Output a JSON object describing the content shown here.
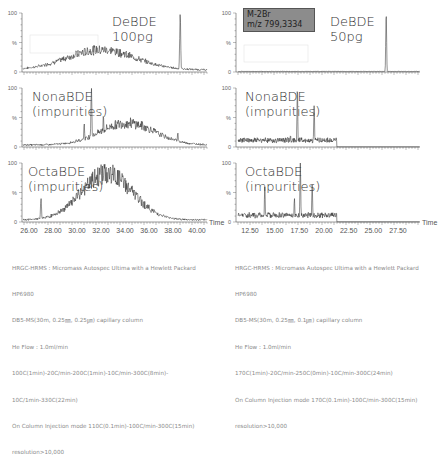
{
  "chart_data": [
    {
      "type": "line",
      "title": "DeBDE 100pg",
      "panel": "left-top",
      "label_lines": [
        "DeBDE",
        "100pg"
      ],
      "xlabel": "Time",
      "ylabel": "%",
      "y_ticks": [
        "100",
        "%",
        "0"
      ],
      "xlim": [
        25.5,
        41.0
      ],
      "ylim": [
        0,
        100
      ],
      "description": "broad hump (max ~35% near 32 min) with sharp peak to 100% near 38.6 min",
      "peaks": [
        {
          "x": 38.6,
          "y": 100
        }
      ],
      "hump": {
        "center": 32.0,
        "height": 35,
        "width": 4.0
      }
    },
    {
      "type": "line",
      "title": "NonaBDE (impurities)",
      "panel": "left-middle",
      "label_lines": [
        "NonaBDE",
        "(impurities)"
      ],
      "xlabel": "Time",
      "ylabel": "%",
      "y_ticks": [
        "100",
        "%",
        "0"
      ],
      "xlim": [
        25.5,
        41.0
      ],
      "ylim": [
        0,
        100
      ],
      "peaks": [
        {
          "x": 31.2,
          "y": 100
        },
        {
          "x": 30.6,
          "y": 40
        },
        {
          "x": 32.2,
          "y": 55
        },
        {
          "x": 38.4,
          "y": 25
        }
      ],
      "hump": {
        "center": 34.2,
        "height": 38,
        "width": 3.2
      }
    },
    {
      "type": "line",
      "title": "OctaBDE (impurities)",
      "panel": "left-bottom",
      "label_lines": [
        "OctaBDE",
        "(impurities)"
      ],
      "xlabel": "Time",
      "ylabel": "%",
      "y_ticks": [
        "100",
        "%",
        "0"
      ],
      "x_ticks": [
        "26.00",
        "28.00",
        "30.00",
        "32.00",
        "34.00",
        "36.00",
        "38.00",
        "40.00"
      ],
      "xlim": [
        25.5,
        41.0
      ],
      "ylim": [
        0,
        100
      ],
      "peaks": [
        {
          "x": 32.0,
          "y": 100
        },
        {
          "x": 27.0,
          "y": 40
        }
      ],
      "hump": {
        "center": 32.5,
        "height": 80,
        "width": 3.0
      }
    },
    {
      "type": "line",
      "title": "DeBDE 50pg",
      "panel": "right-top",
      "label_lines": [
        "DeBDE",
        "50pg"
      ],
      "annotation": [
        "M-2Br",
        "m/z  799,3334"
      ],
      "xlabel": "Time",
      "ylabel": "%",
      "y_ticks": [
        "100",
        "%",
        "0"
      ],
      "xlim": [
        11.3,
        29.7
      ],
      "ylim": [
        0,
        100
      ],
      "peaks": [
        {
          "x": 26.3,
          "y": 100
        }
      ]
    },
    {
      "type": "line",
      "title": "NonaBDE (impurities)",
      "panel": "right-middle",
      "label_lines": [
        "NonaBDE",
        "(impurities)"
      ],
      "xlabel": "Time",
      "ylabel": "%",
      "y_ticks": [
        "100",
        "%",
        "0"
      ],
      "xlim": [
        11.3,
        29.7
      ],
      "ylim": [
        0,
        100
      ],
      "peaks": [
        {
          "x": 16.6,
          "y": 20
        },
        {
          "x": 17.3,
          "y": 100
        },
        {
          "x": 19.0,
          "y": 70
        }
      ],
      "trace_end": 21.3
    },
    {
      "type": "line",
      "title": "OctaBDE (impurities)",
      "panel": "right-bottom",
      "label_lines": [
        "OctaBDE",
        "(impurities)"
      ],
      "xlabel": "Time",
      "ylabel": "%",
      "y_ticks": [
        "100",
        "%",
        "0"
      ],
      "x_ticks": [
        "12.50",
        "15.00",
        "17.50",
        "20.00",
        "22.50",
        "25.00",
        "27.50"
      ],
      "xlim": [
        11.3,
        29.7
      ],
      "ylim": [
        0,
        100
      ],
      "peaks": [
        {
          "x": 14.0,
          "y": 60
        },
        {
          "x": 17.0,
          "y": 40
        },
        {
          "x": 17.6,
          "y": 100
        },
        {
          "x": 18.8,
          "y": 65
        }
      ],
      "trace_end": 21.3
    }
  ],
  "axis": {
    "time_label": "Time",
    "percent_label": "%",
    "y_top": "100",
    "y_bottom": "0"
  },
  "left_x_ticks": [
    "26.00",
    "28.00",
    "30.00",
    "32.00",
    "34.00",
    "36.00",
    "38.00",
    "40.00"
  ],
  "right_x_ticks": [
    "12.50",
    "15.00",
    "17.50",
    "20.00",
    "22.50",
    "25.00",
    "27.50"
  ],
  "ion_box": {
    "line1": "M-2Br",
    "line2": "m/z  799,3334"
  },
  "notes_left": [
    "HRGC-HRMS : Micromass Autospec Ultima with a Hewlett Packard",
    "HP6980",
    "DB5-MS(30m, 0.25㎜, 0.25㎛) capillary column",
    "He Flow : 1.0ml/min",
    "100C(1min)-20C/min-200C(1min)-10C/min-300C(8min)-",
    "10C/1min-330C(22min)",
    "On Column Injection mode 110C(0.1min)-100C/min-300C(15min)",
    "resolution>10,000"
  ],
  "notes_right": [
    "HRGC-HRMS : Micromass Autospec Ultima with a Hewlett Packard",
    "HP6980",
    "DB5-MS(30m, 0.25㎜, 0.1㎛) capillary column",
    "He Flow : 1.0ml/min",
    "170C(1min)-20C/min-250C(0min)-10C/min-300C(24min)",
    "On Column Injection mode 170C(0.1min)-100C/min-300C(15min)",
    "resolution>10,000"
  ]
}
